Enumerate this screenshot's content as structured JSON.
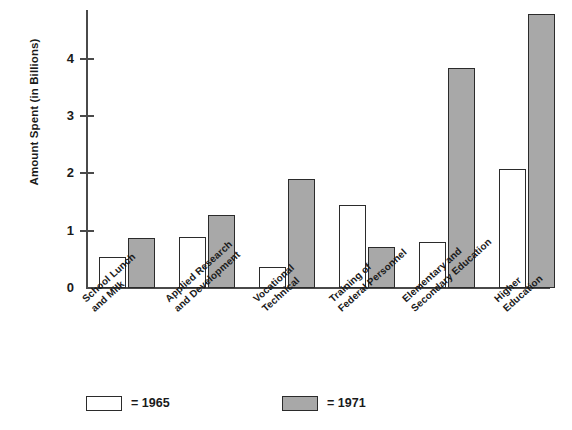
{
  "chart_data": {
    "type": "bar",
    "title": "",
    "xlabel": "",
    "ylabel": "Amount Spent (in Billions)",
    "ylim": [
      0,
      4.85
    ],
    "yticks": [
      0,
      1,
      2,
      3,
      4
    ],
    "ytick_labels": [
      "0",
      "1",
      "2",
      "3",
      "4"
    ],
    "grid": false,
    "legend_position": "bottom",
    "categories": [
      "School Lunch and Milk",
      "Applied Research and Development",
      "Vocational Technical",
      "Training of Federal Personnel",
      "Elementary and Secondary Education",
      "Higher Education"
    ],
    "category_lines": [
      [
        "School Lunch",
        "and Milk"
      ],
      [
        "Applied Research",
        "and Development"
      ],
      [
        "Vocational",
        "Technical"
      ],
      [
        "Training of",
        "Federal Personnel"
      ],
      [
        "Elementary and",
        "Secondary Education"
      ],
      [
        "Higher",
        "Education"
      ]
    ],
    "series": [
      {
        "name": "1965",
        "color": "#ffffff",
        "values": [
          0.54,
          0.89,
          0.36,
          1.44,
          0.81,
          2.08
        ]
      },
      {
        "name": "1971",
        "color": "#a8a8a8",
        "values": [
          0.87,
          1.27,
          1.91,
          0.72,
          3.84,
          4.78
        ]
      }
    ]
  },
  "legend": {
    "items": [
      {
        "label": "= 1965",
        "swatch": "white-square-swatch"
      },
      {
        "label": "= 1971",
        "swatch": "gray-square-swatch"
      }
    ]
  },
  "axes": {
    "y_title": "Amount Spent (in Billions)"
  }
}
